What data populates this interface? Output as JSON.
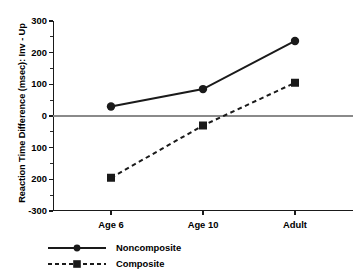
{
  "chart_data": {
    "type": "line",
    "title": "",
    "xlabel": "",
    "ylabel": "Reaction Time Difference (msec): Inv - Up",
    "categories": [
      "Age 6",
      "Age 10",
      "Adult"
    ],
    "series": [
      {
        "name": "Noncomposite",
        "marker": "circle",
        "linestyle": "solid",
        "color": "#1a1a1a",
        "values": [
          30,
          85,
          237
        ]
      },
      {
        "name": "Composite",
        "marker": "square",
        "linestyle": "dashed",
        "color": "#1a1a1a",
        "values": [
          -195,
          -30,
          105
        ]
      }
    ],
    "ylim": [
      -300,
      300
    ],
    "ytick_values": [
      300,
      200,
      100,
      0,
      -100,
      -200,
      -300
    ],
    "ytick_labels": [
      "300",
      "200",
      "100",
      "0",
      "100",
      "200",
      "-300"
    ],
    "yminor_tick_values": [
      250,
      150,
      50,
      -50,
      -150,
      -250
    ],
    "grid": false,
    "zero_reference_line": true,
    "legend_position": "below-left",
    "legend_entries": [
      "Noncomposite",
      "Composite"
    ]
  },
  "axis": {
    "y_title": "Reaction Time Difference (msec): Inv - Up"
  },
  "legend": {
    "items": [
      {
        "label": "Noncomposite"
      },
      {
        "label": "Composite"
      }
    ]
  }
}
